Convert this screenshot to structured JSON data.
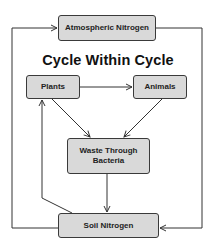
{
  "diagram": {
    "title": "Cycle Within Cycle",
    "nodes": {
      "atmospheric_nitrogen": "Atmospheric Nitrogen",
      "plants": "Plants",
      "animals": "Animals",
      "waste_through_bacteria": "Waste Through Bacteria",
      "soil_nitrogen": "Soil Nitrogen"
    },
    "edges": [
      {
        "from": "Soil Nitrogen",
        "to": "Atmospheric Nitrogen",
        "route": "left outer loop"
      },
      {
        "from": "Atmospheric Nitrogen",
        "to": "Soil Nitrogen",
        "route": "right outer loop"
      },
      {
        "from": "Plants",
        "to": "Animals"
      },
      {
        "from": "Plants",
        "to": "Waste Through Bacteria"
      },
      {
        "from": "Animals",
        "to": "Waste Through Bacteria"
      },
      {
        "from": "Waste Through Bacteria",
        "to": "Soil Nitrogen"
      },
      {
        "from": "Soil Nitrogen",
        "to": "Plants"
      }
    ],
    "colors": {
      "node_fill": "#d9d9d9",
      "node_border": "#3a3a3a",
      "line": "#333333",
      "text": "#222222"
    }
  }
}
